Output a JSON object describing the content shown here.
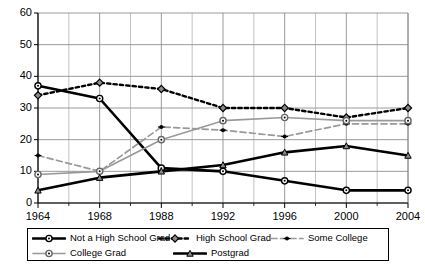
{
  "chart_data": {
    "type": "line",
    "title": "",
    "xlabel": "",
    "ylabel": "",
    "x": [
      1964,
      1968,
      1988,
      1992,
      1996,
      2000,
      2004
    ],
    "xtick_labels": [
      "1964",
      "1968",
      "1988",
      "1992",
      "1996",
      "2000",
      "2004"
    ],
    "ytick_labels": [
      "0",
      "10",
      "20",
      "30",
      "40",
      "50",
      "60"
    ],
    "yticks": [
      0,
      10,
      20,
      30,
      40,
      50,
      60
    ],
    "ylim": [
      0,
      60
    ],
    "grid": true,
    "legend_position": "bottom",
    "series": [
      {
        "name": "Not a High School Grad",
        "values": [
          37,
          33,
          11,
          10,
          7,
          4,
          4
        ],
        "color": "#000000",
        "style": "solid-thick",
        "marker": "circle-open"
      },
      {
        "name": "High School Grad",
        "values": [
          34,
          38,
          36,
          30,
          30,
          27,
          30
        ],
        "color": "#000000",
        "style": "dotted",
        "marker": "diamond"
      },
      {
        "name": "Some College",
        "values": [
          15,
          10,
          24,
          23,
          21,
          25,
          25
        ],
        "color": "#999999",
        "style": "dashed",
        "marker": "cross"
      },
      {
        "name": "College Grad",
        "values": [
          9,
          10,
          20,
          26,
          27,
          26,
          26
        ],
        "color": "#999999",
        "style": "solid-thin",
        "marker": "circle-open"
      },
      {
        "name": "Postgrad",
        "values": [
          4,
          8,
          10,
          12,
          16,
          18,
          15
        ],
        "color": "#000000",
        "style": "solid-thick",
        "marker": "triangle"
      }
    ]
  },
  "legend": {
    "rows": [
      [
        "Not a High School Grad",
        "High School Grad",
        "Some College"
      ],
      [
        "College Grad",
        "Postgrad"
      ]
    ]
  }
}
